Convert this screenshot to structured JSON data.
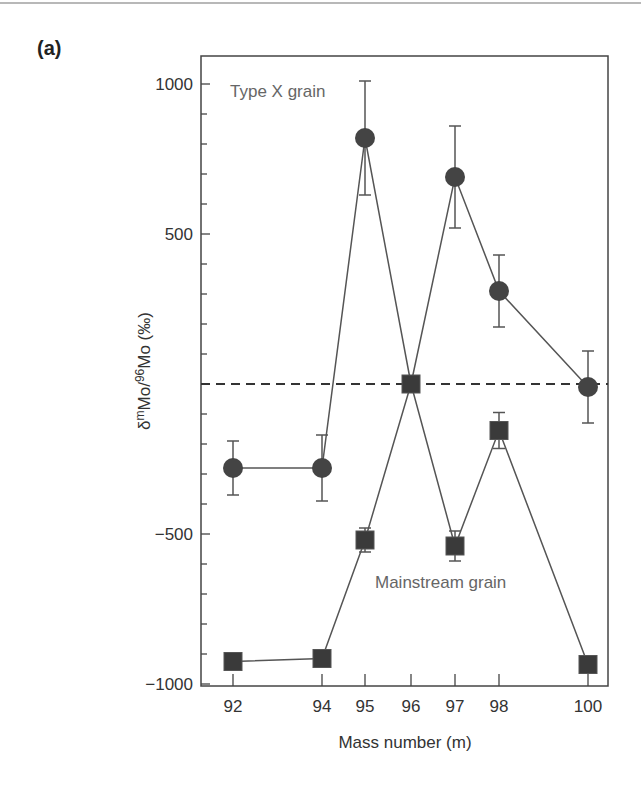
{
  "panel_label": "(a)",
  "chart_data": {
    "type": "line",
    "title": "",
    "xlabel": "Mass number (m)",
    "ylabel": "δmMo/96Mo (‰)",
    "ylabel_parts": {
      "delta": "δ",
      "sup1": "m",
      "mid": "Mo/",
      "sup2": "96",
      "end": "Mo (‰)"
    },
    "x": [
      92,
      94,
      95,
      96,
      97,
      98,
      100
    ],
    "xticks": [
      "92",
      "94",
      "95",
      "96",
      "97",
      "98",
      "100"
    ],
    "yticks": [
      "1000",
      "500",
      "−500",
      "−1000"
    ],
    "ylim": [
      -1000,
      1100
    ],
    "grid": false,
    "reference_line": {
      "y": 0,
      "style": "dashed"
    },
    "series": [
      {
        "name": "Type X grain",
        "marker": "circle",
        "values": [
          -280,
          -280,
          820,
          0,
          690,
          310,
          -10
        ],
        "errors": [
          90,
          110,
          190,
          null,
          170,
          120,
          120
        ]
      },
      {
        "name": "Mainstream grain",
        "marker": "square",
        "values": [
          -925,
          -915,
          -520,
          0,
          -540,
          -155,
          -935
        ],
        "errors": [
          null,
          null,
          40,
          null,
          50,
          60,
          null
        ]
      }
    ],
    "annotations": [
      {
        "text": "Type X grain",
        "x": 92.3,
        "y": 980
      },
      {
        "text": "Mainstream grain",
        "x": 96.3,
        "y": -650
      }
    ]
  }
}
